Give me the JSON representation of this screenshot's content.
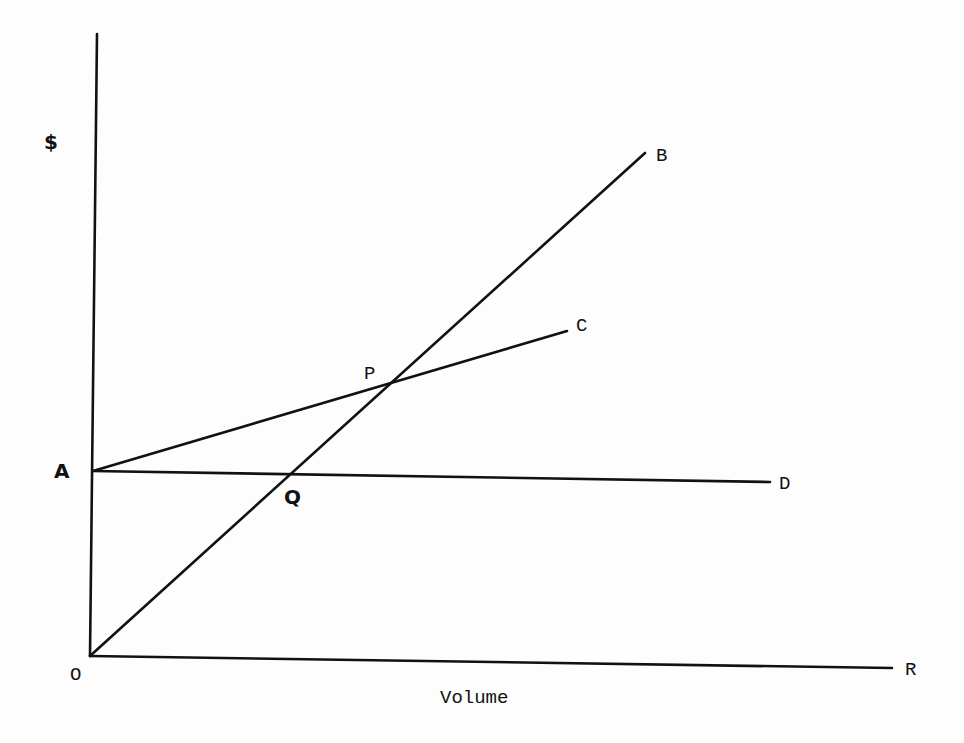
{
  "diagram": {
    "type": "cost-volume-profit",
    "y_axis_label": "$",
    "x_axis_label": "Volume",
    "points": {
      "O": {
        "label": "O",
        "x": 90,
        "y": 656,
        "lx": 70,
        "ly": 680
      },
      "A": {
        "label": "A",
        "x": 93,
        "y": 471,
        "lx": 54,
        "ly": 478
      },
      "B": {
        "label": "B",
        "x": 645,
        "y": 153,
        "lx": 656,
        "ly": 161
      },
      "C": {
        "label": "C",
        "x": 567,
        "y": 331,
        "lx": 576,
        "ly": 331
      },
      "D": {
        "label": "D",
        "x": 770,
        "y": 482,
        "lx": 779,
        "ly": 489
      },
      "R": {
        "label": "R",
        "x": 892,
        "y": 668,
        "lx": 905,
        "ly": 675
      },
      "P": {
        "label": "P",
        "x": 395,
        "y": 382,
        "lx": 364,
        "ly": 379
      },
      "Q": {
        "label": "Q",
        "x": 287,
        "y": 475,
        "lx": 284,
        "ly": 504
      }
    },
    "lines": [
      {
        "name": "y-axis",
        "from": [
          97,
          34
        ],
        "to": [
          90,
          656
        ]
      },
      {
        "name": "x-axis",
        "from": [
          90,
          656
        ],
        "to": [
          892,
          668
        ]
      },
      {
        "name": "line-OB",
        "from": [
          90,
          656
        ],
        "to": [
          645,
          153
        ]
      },
      {
        "name": "line-AC",
        "from": [
          93,
          471
        ],
        "to": [
          567,
          331
        ]
      },
      {
        "name": "line-AD",
        "from": [
          93,
          471
        ],
        "to": [
          770,
          482
        ]
      }
    ],
    "axis_label_pos": {
      "y": {
        "x": 44,
        "y": 149
      },
      "x": {
        "x": 440,
        "y": 703
      }
    }
  }
}
